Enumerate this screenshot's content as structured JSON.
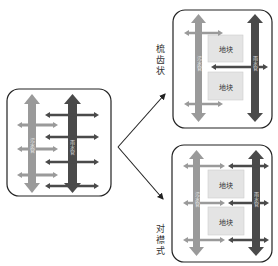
{
  "diagram": {
    "left_panel": {
      "pipes": [
        {
          "name": "污水管",
          "color": "#9a9a9a"
        },
        {
          "name": "雨水管",
          "color": "#4a4a4a"
        }
      ]
    },
    "top_right_panel": {
      "layout_label": "梳齿状",
      "blocks": [
        "地块",
        "地块"
      ],
      "pipes": [
        {
          "name": "污水管",
          "color": "#9a9a9a"
        },
        {
          "name": "雨水管",
          "color": "#4a4a4a"
        }
      ]
    },
    "bottom_right_panel": {
      "layout_label": "对襟式",
      "blocks": [
        "地块",
        "地块"
      ],
      "pipes": [
        {
          "name": "污水管",
          "color": "#9a9a9a"
        },
        {
          "name": "雨水管",
          "color": "#4a4a4a"
        }
      ]
    },
    "colors": {
      "light_pipe": "#9a9a9a",
      "dark_pipe": "#4a4a4a",
      "block_fill": "#e4e4e4",
      "panel_border": "#222222"
    }
  }
}
